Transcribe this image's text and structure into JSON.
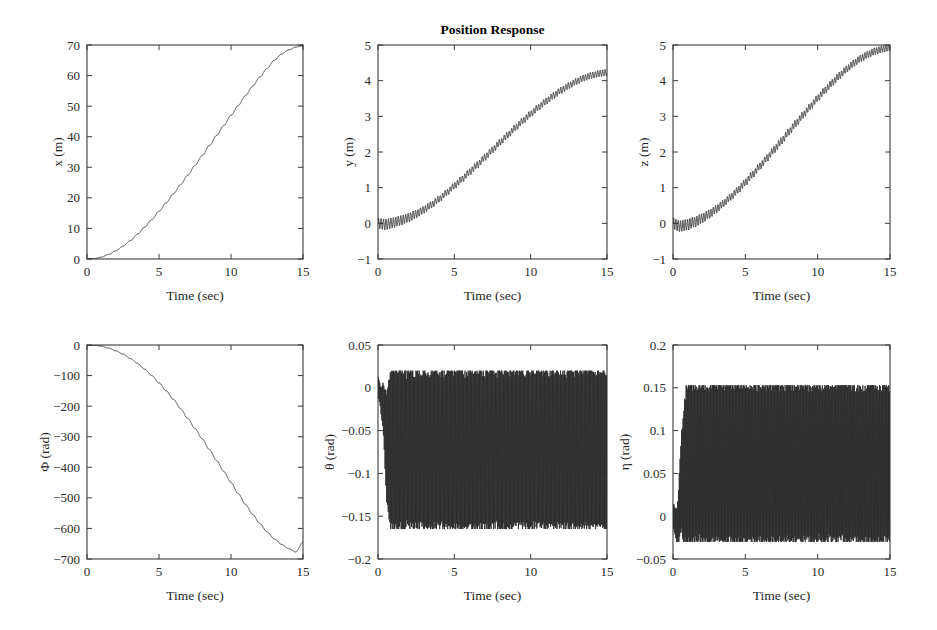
{
  "figure": {
    "title": "Position Response",
    "width": 937,
    "height": 630,
    "background": "#ffffff",
    "curve_color": "#2a2a2a",
    "axis_color": "#3b3b3b",
    "rows": 2,
    "cols": 3
  },
  "chart_data": [
    {
      "id": "x-position",
      "type": "line",
      "title": "Position Response",
      "title_visible": false,
      "xlabel": "Time (sec)",
      "ylabel": "x (m)",
      "xlim": [
        0,
        15
      ],
      "ylim": [
        0,
        70
      ],
      "xticks": [
        0,
        5,
        10,
        15
      ],
      "xticklabels": [
        "0",
        "5",
        "10",
        "15"
      ],
      "yticks": [
        0,
        10,
        20,
        30,
        40,
        50,
        60,
        70
      ],
      "yticklabels": [
        "0",
        "10",
        "20",
        "30",
        "40",
        "50",
        "60",
        "70"
      ],
      "grid": false,
      "legend": null,
      "oscillation": {
        "amplitude": 0.0,
        "frequency": 0.0
      },
      "x": [
        0,
        0.5,
        1,
        1.5,
        2,
        2.5,
        3,
        3.5,
        4,
        4.5,
        5,
        5.5,
        6,
        6.5,
        7,
        7.5,
        8,
        8.5,
        9,
        9.5,
        10,
        10.5,
        11,
        11.5,
        12,
        12.5,
        13,
        13.5,
        14,
        14.5,
        15
      ],
      "values": [
        0,
        0.12,
        0.6,
        1.5,
        2.7,
        4.2,
        6.0,
        8.1,
        10.4,
        12.9,
        15.6,
        18.4,
        21.3,
        24.3,
        27.4,
        30.6,
        33.8,
        37.1,
        40.4,
        43.7,
        47.0,
        50.2,
        53.4,
        56.5,
        59.5,
        62.3,
        65.0,
        67.0,
        68.4,
        69.3,
        69.8
      ]
    },
    {
      "id": "y-position",
      "type": "line",
      "title": "Position Response",
      "title_visible": true,
      "xlabel": "Time (sec)",
      "ylabel": "y (m)",
      "xlim": [
        0,
        15
      ],
      "ylim": [
        -1,
        5
      ],
      "xticks": [
        0,
        5,
        10,
        15
      ],
      "xticklabels": [
        "0",
        "5",
        "10",
        "15"
      ],
      "yticks": [
        -1,
        0,
        1,
        2,
        3,
        4,
        5
      ],
      "yticklabels": [
        "−1",
        "0",
        "1",
        "2",
        "3",
        "4",
        "5"
      ],
      "grid": false,
      "legend": null,
      "oscillation": {
        "amplitude": 0.085,
        "frequency": 6.2,
        "ramp_start": 0.4,
        "ramp_end": 4.0,
        "initial_amplitude": 0.14
      },
      "x": [
        0,
        0.5,
        1,
        1.5,
        2,
        2.5,
        3,
        3.5,
        4,
        4.5,
        5,
        5.5,
        6,
        6.5,
        7,
        7.5,
        8,
        8.5,
        9,
        9.5,
        10,
        10.5,
        11,
        11.5,
        12,
        12.5,
        13,
        13.5,
        14,
        14.5,
        15
      ],
      "values": [
        0,
        -0.03,
        0.02,
        0.08,
        0.16,
        0.26,
        0.38,
        0.52,
        0.68,
        0.86,
        1.05,
        1.24,
        1.44,
        1.64,
        1.85,
        2.06,
        2.27,
        2.48,
        2.68,
        2.88,
        3.07,
        3.25,
        3.42,
        3.58,
        3.73,
        3.86,
        3.98,
        4.08,
        4.15,
        4.2,
        4.23
      ]
    },
    {
      "id": "z-position",
      "type": "line",
      "title": "Position Response",
      "title_visible": false,
      "xlabel": "Time (sec)",
      "ylabel": "z (m)",
      "xlim": [
        0,
        15
      ],
      "ylim": [
        -1,
        5
      ],
      "xticks": [
        0,
        5,
        10,
        15
      ],
      "xticklabels": [
        "0",
        "5",
        "10",
        "15"
      ],
      "yticks": [
        -1,
        0,
        1,
        2,
        3,
        4,
        5
      ],
      "yticklabels": [
        "−1",
        "0",
        "1",
        "2",
        "3",
        "4",
        "5"
      ],
      "grid": false,
      "legend": null,
      "oscillation": {
        "amplitude": 0.09,
        "frequency": 6.2,
        "ramp_start": 0.4,
        "ramp_end": 4.0,
        "initial_amplitude": 0.15
      },
      "x": [
        0,
        0.5,
        1,
        1.5,
        2,
        2.5,
        3,
        3.5,
        4,
        4.5,
        5,
        5.5,
        6,
        6.5,
        7,
        7.5,
        8,
        8.5,
        9,
        9.5,
        10,
        10.5,
        11,
        11.5,
        12,
        12.5,
        13,
        13.5,
        14,
        14.5,
        15
      ],
      "values": [
        0,
        -0.08,
        -0.04,
        0.04,
        0.14,
        0.26,
        0.4,
        0.56,
        0.74,
        0.94,
        1.15,
        1.37,
        1.6,
        1.83,
        2.07,
        2.31,
        2.56,
        2.8,
        3.04,
        3.28,
        3.51,
        3.73,
        3.94,
        4.14,
        4.32,
        4.49,
        4.63,
        4.74,
        4.83,
        4.89,
        4.93
      ]
    },
    {
      "id": "phi-angle",
      "type": "line",
      "title": "Position Response",
      "title_visible": false,
      "xlabel": "Time (sec)",
      "ylabel": "Φ (rad)",
      "xlim": [
        0,
        15
      ],
      "ylim": [
        -700,
        0
      ],
      "xticks": [
        0,
        5,
        10,
        15
      ],
      "xticklabels": [
        "0",
        "5",
        "10",
        "15"
      ],
      "yticks": [
        -700,
        -600,
        -500,
        -400,
        -300,
        -200,
        -100,
        0
      ],
      "yticklabels": [
        "−700",
        "−600",
        "−500",
        "−400",
        "−300",
        "−200",
        "−100",
        "0"
      ],
      "grid": false,
      "legend": null,
      "oscillation": {
        "amplitude": 0.0,
        "frequency": 0.0
      },
      "x": [
        0,
        0.5,
        1,
        1.5,
        2,
        2.5,
        3,
        3.5,
        4,
        4.5,
        5,
        5.5,
        6,
        6.5,
        7,
        7.5,
        8,
        8.5,
        9,
        9.5,
        10,
        10.5,
        11,
        11.5,
        12,
        12.5,
        13,
        13.5,
        14,
        14.5,
        15
      ],
      "values": [
        0,
        -1,
        -4,
        -10,
        -19,
        -30,
        -44,
        -60,
        -79,
        -100,
        -124,
        -150,
        -178,
        -208,
        -240,
        -273,
        -307,
        -342,
        -378,
        -414,
        -450,
        -486,
        -521,
        -554,
        -584,
        -611,
        -634,
        -652,
        -666,
        -677,
        -645
      ]
    },
    {
      "id": "theta-angle",
      "type": "line",
      "title": "Position Response",
      "title_visible": false,
      "xlabel": "Time (sec)",
      "ylabel": "θ (rad)",
      "xlim": [
        0,
        15
      ],
      "ylim": [
        -0.2,
        0.05
      ],
      "xticks": [
        0,
        5,
        10,
        15
      ],
      "xticklabels": [
        "0",
        "5",
        "10",
        "15"
      ],
      "yticks": [
        -0.2,
        -0.15,
        -0.1,
        -0.05,
        0,
        0.05
      ],
      "yticklabels": [
        "−0.2",
        "−0.15",
        "−0.1",
        "−0.05",
        "0",
        "0.05"
      ],
      "grid": false,
      "legend": null,
      "oscillation": {
        "amplitude": 0.092,
        "frequency": 19.0,
        "ramp_start": 0.1,
        "ramp_end": 0.9,
        "initial_amplitude": 0.012
      },
      "envelope_min": -0.165,
      "envelope_max": 0.02,
      "x": [
        0,
        0.3,
        0.6,
        1,
        2,
        3,
        5,
        7,
        9,
        11,
        13,
        15
      ],
      "values": [
        0,
        -0.02,
        -0.07,
        -0.072,
        -0.072,
        -0.072,
        -0.072,
        -0.072,
        -0.072,
        -0.072,
        -0.072,
        -0.072
      ]
    },
    {
      "id": "eta-angle",
      "type": "line",
      "title": "Position Response",
      "title_visible": false,
      "xlabel": "Time (sec)",
      "ylabel": "η (rad)",
      "xlim": [
        0,
        15
      ],
      "ylim": [
        -0.05,
        0.2
      ],
      "xticks": [
        0,
        5,
        10,
        15
      ],
      "xticklabels": [
        "0",
        "5",
        "10",
        "15"
      ],
      "yticks": [
        -0.05,
        0,
        0.05,
        0.1,
        0.15,
        0.2
      ],
      "yticklabels": [
        "−0.05",
        "0",
        "0.05",
        "0.1",
        "0.15",
        "0.2"
      ],
      "grid": false,
      "legend": null,
      "oscillation": {
        "amplitude": 0.0915,
        "frequency": 19.0,
        "ramp_start": 0.1,
        "ramp_end": 1.0,
        "initial_amplitude": 0.015
      },
      "envelope_min": -0.03,
      "envelope_max": 0.153,
      "x": [
        0,
        0.3,
        0.6,
        1,
        2,
        3,
        5,
        7,
        9,
        11,
        13,
        15
      ],
      "values": [
        0,
        -0.012,
        0.04,
        0.0615,
        0.0615,
        0.0615,
        0.0615,
        0.0615,
        0.0615,
        0.0615,
        0.0615,
        0.0615
      ]
    }
  ]
}
